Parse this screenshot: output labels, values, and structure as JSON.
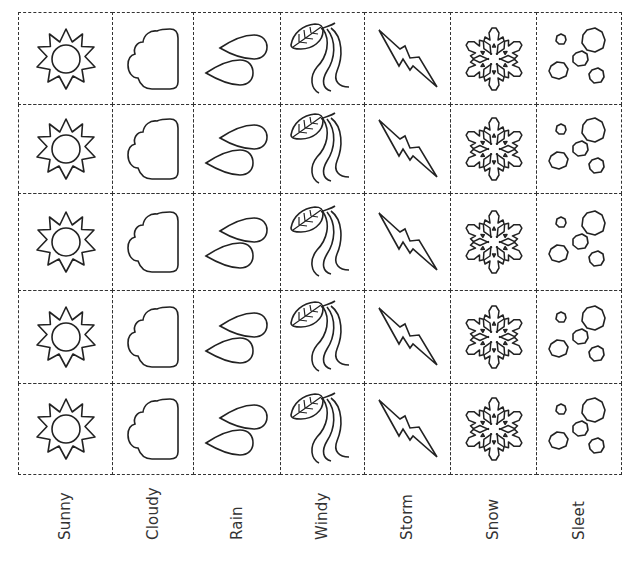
{
  "worksheet": {
    "columns": [
      {
        "key": "sunny",
        "label": "Sunny",
        "icon": "sun-icon"
      },
      {
        "key": "cloudy",
        "label": "Cloudy",
        "icon": "cloud-icon"
      },
      {
        "key": "rain",
        "label": "Rain",
        "icon": "raindrops-icon"
      },
      {
        "key": "windy",
        "label": "Windy",
        "icon": "wind-leaf-icon"
      },
      {
        "key": "storm",
        "label": "Storm",
        "icon": "lightning-bolt-icon"
      },
      {
        "key": "snow",
        "label": "Snow",
        "icon": "snowflake-icon"
      },
      {
        "key": "sleet",
        "label": "Sleet",
        "icon": "sleet-pellets-icon"
      }
    ],
    "rows": 5,
    "column_edges": [
      18,
      112,
      193,
      280,
      364,
      450,
      536,
      621
    ],
    "row_edges": [
      12,
      104,
      193,
      290,
      383,
      474
    ],
    "line_color": "#333333",
    "border_style": "dashed"
  }
}
